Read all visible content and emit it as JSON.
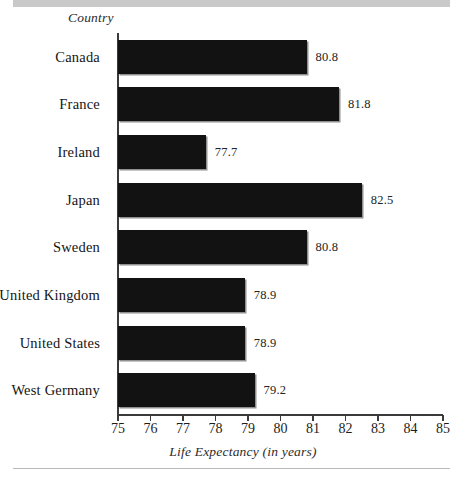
{
  "figure": {
    "category_axis_header": "Country",
    "x_axis_title": "Life Expectancy (in years)"
  },
  "style": {
    "bar_color": "#121212",
    "axis_color": "#3a3a3a",
    "rule_color": "#c9c9c9",
    "text_color": "#1a1a1a"
  },
  "chart_data": {
    "type": "bar",
    "orientation": "horizontal",
    "title": "",
    "subtitle": "",
    "xlabel": "Life Expectancy (in years)",
    "ylabel": "Country",
    "xlim": [
      75,
      85
    ],
    "xticks": [
      75,
      76,
      77,
      78,
      79,
      80,
      81,
      82,
      83,
      84,
      85
    ],
    "xtick_labels": [
      "75",
      "76",
      "77",
      "78",
      "79",
      "80",
      "81",
      "82",
      "83",
      "84",
      "85"
    ],
    "grid": false,
    "legend": null,
    "data_labels": true,
    "categories": [
      "Canada",
      "France",
      "Ireland",
      "Japan",
      "Sweden",
      "United Kingdom",
      "United States",
      "West Germany"
    ],
    "values": [
      80.8,
      81.8,
      77.7,
      82.5,
      80.8,
      78.9,
      78.9,
      79.2
    ],
    "value_labels": [
      "80.8",
      "81.8",
      "77.7",
      "82.5",
      "80.8",
      "78.9",
      "78.9",
      "79.2"
    ],
    "series": [
      {
        "name": "Life Expectancy",
        "values": [
          80.8,
          81.8,
          77.7,
          82.5,
          80.8,
          78.9,
          78.9,
          79.2
        ]
      }
    ]
  }
}
